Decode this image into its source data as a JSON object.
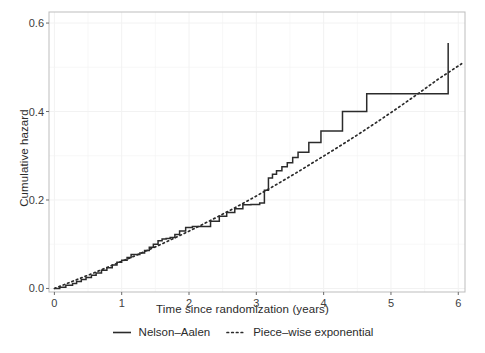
{
  "chart_data": {
    "type": "line",
    "title": "",
    "subtitle": "",
    "xlabel": "Time since randomization (years)",
    "ylabel": "Cumulative hazard",
    "xlim": [
      -0.08,
      6.1
    ],
    "ylim": [
      -0.008,
      0.625
    ],
    "xticks": [
      0,
      1,
      2,
      3,
      4,
      5,
      6
    ],
    "xticklabels": [
      "0",
      "1",
      "2",
      "3",
      "4",
      "5",
      "6"
    ],
    "yticks": [
      0.0,
      0.2,
      0.4,
      0.6
    ],
    "yticklabels": [
      "0.0",
      "0.2",
      "0.4",
      "0.6"
    ],
    "grid": true,
    "grid_color": "#f2f2f2",
    "panel_background": "#ffffff",
    "panel_border_color": "#bdbdbd",
    "legend_position": "bottom",
    "series": [
      {
        "name": "Nelson-Aalen",
        "label": "Nelson–Aalen",
        "style": "step",
        "linetype": "solid",
        "color": "#2b2b2b",
        "x": [
          0.0,
          0.08,
          0.17,
          0.27,
          0.33,
          0.4,
          0.47,
          0.55,
          0.62,
          0.7,
          0.78,
          0.86,
          0.93,
          1.0,
          1.08,
          1.14,
          1.2,
          1.27,
          1.34,
          1.41,
          1.47,
          1.54,
          1.6,
          1.66,
          1.72,
          1.79,
          1.86,
          1.95,
          2.05,
          2.2,
          2.32,
          2.45,
          2.56,
          2.68,
          2.8,
          2.92,
          3.05,
          3.12,
          3.18,
          3.24,
          3.3,
          3.38,
          3.46,
          3.54,
          3.62,
          3.78,
          3.96,
          4.28,
          4.64,
          5.85
        ],
        "y": [
          0.0,
          0.003,
          0.007,
          0.011,
          0.016,
          0.02,
          0.025,
          0.03,
          0.035,
          0.041,
          0.047,
          0.053,
          0.059,
          0.064,
          0.07,
          0.077,
          0.077,
          0.08,
          0.086,
          0.093,
          0.1,
          0.108,
          0.112,
          0.113,
          0.115,
          0.122,
          0.13,
          0.138,
          0.14,
          0.14,
          0.152,
          0.163,
          0.172,
          0.18,
          0.189,
          0.19,
          0.193,
          0.222,
          0.25,
          0.258,
          0.266,
          0.275,
          0.284,
          0.296,
          0.308,
          0.33,
          0.356,
          0.4,
          0.44,
          0.555
        ]
      },
      {
        "name": "Piece-wise exponential",
        "label": "Piece–wise exponential",
        "style": "line",
        "linetype": "dotted",
        "color": "#2b2b2b",
        "x": [
          0.0,
          0.3,
          0.6,
          0.9,
          1.2,
          1.5,
          1.8,
          2.1,
          2.4,
          2.7,
          3.0,
          3.3,
          3.6,
          3.9,
          4.2,
          4.5,
          4.8,
          5.1,
          5.4,
          5.7,
          6.05
        ],
        "y": [
          0.0,
          0.018,
          0.036,
          0.055,
          0.074,
          0.094,
          0.115,
          0.137,
          0.16,
          0.184,
          0.209,
          0.235,
          0.262,
          0.29,
          0.318,
          0.347,
          0.377,
          0.408,
          0.44,
          0.473,
          0.508
        ]
      }
    ],
    "annotations": []
  },
  "legend": {
    "items": [
      {
        "label": "Nelson–Aalen",
        "key": "solid-line-key"
      },
      {
        "label": "Piece–wise exponential",
        "key": "dotted-line-key"
      }
    ]
  }
}
